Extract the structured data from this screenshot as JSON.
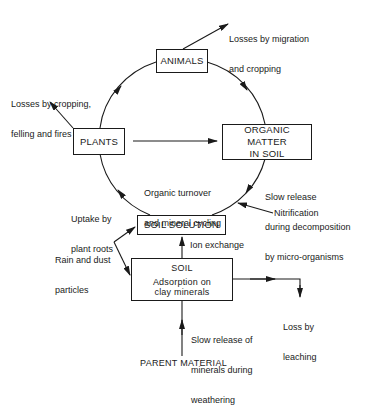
{
  "boxes": {
    "animals": "ANIMALS",
    "plants": "PLANTS",
    "organic_matter": {
      "line1": "ORGANIC MATTER",
      "line2": "IN SOIL"
    },
    "soil_solution": "SOIL SOLUTION",
    "soil": {
      "title": "SOIL",
      "line1": "Adsorption on",
      "line2": "clay minerals"
    }
  },
  "labels": {
    "losses_migration": {
      "line1": "Losses by migration",
      "line2": "and cropping"
    },
    "losses_cropping": {
      "line1": "Losses by cropping,",
      "line2": "felling and fires"
    },
    "organic_turnover": {
      "line1": "Organic turnover",
      "line2": "and mineral cycling"
    },
    "slow_release_decomp": {
      "line1": "Slow release",
      "line2": "during decomposition",
      "line3": "by micro-organisms"
    },
    "nitrification": "Nitrification",
    "uptake": {
      "line1": "Uptake by",
      "line2": "plant roots"
    },
    "rain_dust": {
      "line1": "Rain and dust",
      "line2": "particles"
    },
    "ion_exchange": "Ion exchange",
    "loss_leaching": {
      "line1": "Loss by",
      "line2": "leaching"
    },
    "slow_release_weathering": {
      "line1": "Slow release of",
      "line2": "minerals during",
      "line3": "weathering"
    },
    "parent_material": "PARENT MATERIAL"
  }
}
